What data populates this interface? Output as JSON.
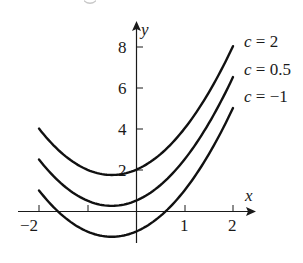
{
  "chart_data": {
    "type": "line",
    "title": "",
    "xlabel": "x",
    "ylabel": "y",
    "xlim": [
      -2,
      2
    ],
    "ylim": [
      -1.25,
      8
    ],
    "grid": false,
    "x_ticks": [
      -2,
      -1,
      1,
      2
    ],
    "x_tick_labels": [
      "−2",
      "",
      "1",
      "2"
    ],
    "y_ticks": [
      2,
      4,
      6,
      8
    ],
    "y_tick_labels": [
      "2",
      "4",
      "6",
      "8"
    ],
    "family": "y = x^2 + x + c",
    "x": [
      -2,
      -1.5,
      -1,
      -0.5,
      0,
      0.5,
      1,
      1.5,
      2
    ],
    "series": [
      {
        "name": "c = 2",
        "c": 2,
        "label": "c = 2",
        "values": [
          4.0,
          2.75,
          2.0,
          1.75,
          2.0,
          2.75,
          4.0,
          5.75,
          8.0
        ]
      },
      {
        "name": "c = 0.5",
        "c": 0.5,
        "label": "c = 0.5",
        "values": [
          2.5,
          1.25,
          0.5,
          0.25,
          0.5,
          1.25,
          2.5,
          4.25,
          6.5
        ]
      },
      {
        "name": "c = -1",
        "c": -1,
        "label": "c = −1",
        "values": [
          1.0,
          -0.25,
          -1.0,
          -1.25,
          -1.0,
          -0.25,
          1.0,
          2.75,
          5.0
        ]
      }
    ],
    "annotations": [
      "c = 2",
      "c = 0.5",
      "c = −1"
    ],
    "legend_position": "inline-right"
  },
  "axes": {
    "x_label": "x",
    "y_label": "y"
  },
  "ticks": {
    "x": {
      "m2": "−2",
      "p1": "1",
      "p2": "2"
    },
    "y": {
      "y2": "2",
      "y4": "4",
      "y6": "6",
      "y8": "8"
    }
  },
  "labels": {
    "c_prefix": "c",
    "eq": " = ",
    "c2": "2",
    "c05": "0.5",
    "cm1": "−1"
  },
  "colors": {
    "curve": "#111111",
    "axis": "#1a1a1a",
    "background": "#ffffff"
  }
}
